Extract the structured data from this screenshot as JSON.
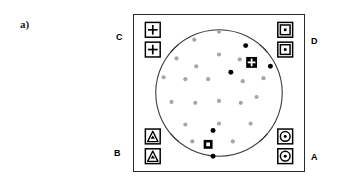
{
  "figure": {
    "panel_label": "a)",
    "type": "diagram"
  },
  "corner_labels": {
    "top_left": "C",
    "top_right": "D",
    "bottom_left": "B",
    "bottom_right": "A"
  },
  "frame": {
    "x": 133,
    "y": 14,
    "width": 172,
    "height": 158,
    "stroke": "#2b2b2b",
    "fill": "#ffffff"
  },
  "fiducials": [
    {
      "group": "C",
      "glyph": "crosshair-square",
      "count": 2,
      "positions": [
        {
          "cx": 19,
          "cy": 15
        },
        {
          "cx": 19,
          "cy": 35
        }
      ],
      "size": 15
    },
    {
      "group": "D",
      "glyph": "concentric-square",
      "count": 2,
      "positions": [
        {
          "cx": 153,
          "cy": 15
        },
        {
          "cx": 153,
          "cy": 35
        }
      ],
      "size": 15
    },
    {
      "group": "B",
      "glyph": "triangle-square",
      "count": 2,
      "positions": [
        {
          "cx": 19,
          "cy": 123
        },
        {
          "cx": 19,
          "cy": 143
        }
      ],
      "size": 15
    },
    {
      "group": "A",
      "glyph": "circle-square",
      "count": 2,
      "positions": [
        {
          "cx": 153,
          "cy": 123
        },
        {
          "cx": 153,
          "cy": 143
        }
      ],
      "size": 15
    }
  ],
  "arcs": {
    "stroke": "#3a3a3a",
    "stroke_width": 1.1,
    "center": {
      "cx": 86,
      "cy": 79
    },
    "radius": 64,
    "segments": [
      {
        "name": "top-arc",
        "start_deg": 220,
        "end_deg": 320
      },
      {
        "name": "right-arc",
        "start_deg": 310,
        "end_deg": 50
      },
      {
        "name": "bottom-arc",
        "start_deg": 40,
        "end_deg": 140
      },
      {
        "name": "left-arc",
        "start_deg": 130,
        "end_deg": 230
      }
    ]
  },
  "dots": {
    "gray_color": "#a6a6a6",
    "black_color": "#000000",
    "radius": 2.1,
    "gray": [
      {
        "cx": 86,
        "cy": 17
      },
      {
        "cx": 61,
        "cy": 25
      },
      {
        "cx": 86,
        "cy": 40
      },
      {
        "cx": 43,
        "cy": 44
      },
      {
        "cx": 63,
        "cy": 52
      },
      {
        "cx": 107,
        "cy": 45
      },
      {
        "cx": 30,
        "cy": 63
      },
      {
        "cx": 52,
        "cy": 65
      },
      {
        "cx": 75,
        "cy": 65
      },
      {
        "cx": 110,
        "cy": 67
      },
      {
        "cx": 131,
        "cy": 64
      },
      {
        "cx": 38,
        "cy": 88
      },
      {
        "cx": 62,
        "cy": 89
      },
      {
        "cx": 86,
        "cy": 87
      },
      {
        "cx": 108,
        "cy": 89
      },
      {
        "cx": 124,
        "cy": 83
      },
      {
        "cx": 52,
        "cy": 111
      },
      {
        "cx": 86,
        "cy": 110
      },
      {
        "cx": 118,
        "cy": 110
      },
      {
        "cx": 59,
        "cy": 128
      },
      {
        "cx": 100,
        "cy": 128
      }
    ],
    "black": [
      {
        "cx": 113,
        "cy": 31
      },
      {
        "cx": 98,
        "cy": 58
      },
      {
        "cx": 138,
        "cy": 52
      },
      {
        "cx": 80,
        "cy": 117
      },
      {
        "cx": 80,
        "cy": 143
      }
    ]
  },
  "special_markers": [
    {
      "name": "grid-square-marker",
      "glyph": "filled-square-with-white-cross",
      "cx": 119,
      "cy": 48,
      "size": 11,
      "fill": "#000000",
      "inner": "#ffffff"
    },
    {
      "name": "dot-square-marker",
      "glyph": "filled-square-with-white-center",
      "cx": 75,
      "cy": 131,
      "size": 9,
      "fill": "#000000",
      "inner": "#ffffff"
    }
  ]
}
